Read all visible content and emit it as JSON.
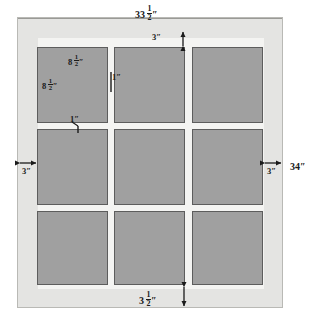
{
  "diagram": {
    "units": "inches",
    "colors": {
      "frame": "#e4e4e2",
      "frame_border": "#b9b9b5",
      "field": "#f4f4f2",
      "pane_fill": "#a0a0a0",
      "pane_border": "#5d5d5d",
      "text": "#1a1a1a",
      "background": "#ffffff"
    }
  },
  "labels": {
    "top_overall": {
      "whole": "33",
      "num": "1",
      "den": "2",
      "unit": "″"
    },
    "top_margin": {
      "whole": "3",
      "num": "",
      "den": "",
      "unit": "″"
    },
    "left_margin": {
      "whole": "3",
      "num": "",
      "den": "",
      "unit": "″"
    },
    "right_margin": {
      "whole": "3",
      "num": "",
      "den": "",
      "unit": "″"
    },
    "right_overall": {
      "whole": "34",
      "num": "",
      "den": "",
      "unit": "″"
    },
    "bottom_margin": {
      "whole": "3",
      "num": "1",
      "den": "2",
      "unit": "″"
    },
    "pane_width": {
      "whole": "8",
      "num": "1",
      "den": "2",
      "unit": "″"
    },
    "pane_height": {
      "whole": "8",
      "num": "1",
      "den": "2",
      "unit": "″"
    },
    "sash_vertical": {
      "whole": "1",
      "num": "",
      "den": "",
      "unit": "″"
    },
    "sash_horizontal": {
      "whole": "1",
      "num": "",
      "den": "",
      "unit": "″"
    }
  },
  "panes": [
    {
      "id": "pane-r1c1",
      "row": 1,
      "col": 1
    },
    {
      "id": "pane-r1c2",
      "row": 1,
      "col": 2
    },
    {
      "id": "pane-r1c3",
      "row": 1,
      "col": 3
    },
    {
      "id": "pane-r2c1",
      "row": 2,
      "col": 1
    },
    {
      "id": "pane-r2c2",
      "row": 2,
      "col": 2
    },
    {
      "id": "pane-r2c3",
      "row": 2,
      "col": 3
    },
    {
      "id": "pane-r3c1",
      "row": 3,
      "col": 1
    },
    {
      "id": "pane-r3c2",
      "row": 3,
      "col": 2
    },
    {
      "id": "pane-r3c3",
      "row": 3,
      "col": 3
    }
  ],
  "caption": ""
}
